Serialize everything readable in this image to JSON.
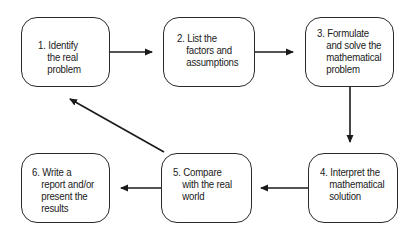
{
  "diagram": {
    "type": "flowchart",
    "steps": [
      {
        "id": 1,
        "number": "1.",
        "lines": [
          "Identify",
          "the real",
          "problem"
        ]
      },
      {
        "id": 2,
        "number": "2.",
        "lines": [
          "List the",
          "factors and",
          "assumptions"
        ]
      },
      {
        "id": 3,
        "number": "3.",
        "lines": [
          "Formulate",
          "and solve the",
          "mathematical",
          "problem"
        ]
      },
      {
        "id": 4,
        "number": "4.",
        "lines": [
          "Interpret the",
          "mathematical",
          "solution"
        ]
      },
      {
        "id": 5,
        "number": "5.",
        "lines": [
          "Compare",
          "with the real",
          "world"
        ]
      },
      {
        "id": 6,
        "number": "6.",
        "lines": [
          "Write a",
          "report and/or",
          "present the",
          "results"
        ]
      }
    ],
    "edges": [
      {
        "from": 1,
        "to": 2
      },
      {
        "from": 2,
        "to": 3
      },
      {
        "from": 3,
        "to": 4
      },
      {
        "from": 4,
        "to": 5
      },
      {
        "from": 5,
        "to": 6
      },
      {
        "from": 5,
        "to": 1
      }
    ],
    "colors": {
      "stroke": "#2a2a2a",
      "text": "#1a1a1a",
      "background": "#ffffff"
    }
  }
}
